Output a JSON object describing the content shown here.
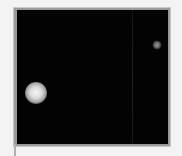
{
  "image": {
    "description": "Dark micrograph-style panel with two bright circular spots",
    "background_color": "#030303",
    "frame_color": "#9a9a9a",
    "page_color": "#f3f3f3",
    "spots": [
      {
        "name": "large-bright-spot",
        "cx": 19,
        "cy": 83,
        "diameter": 22
      },
      {
        "name": "small-faint-spot",
        "cx": 140,
        "cy": 35,
        "diameter": 9
      }
    ],
    "streak": {
      "x": 115
    }
  }
}
